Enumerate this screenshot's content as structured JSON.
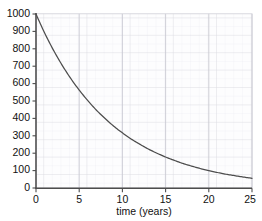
{
  "chart_data": {
    "type": "line",
    "title": "",
    "subtitle": "",
    "xlabel": "time (years)",
    "ylabel": "",
    "xlim": [
      0,
      25
    ],
    "ylim": [
      0,
      1000
    ],
    "xticks": [
      0,
      5,
      10,
      15,
      20,
      25
    ],
    "xtick_labels": [
      "0",
      "5",
      "10",
      "15",
      "20",
      "25"
    ],
    "yticks": [
      0,
      100,
      200,
      300,
      400,
      500,
      600,
      700,
      800,
      900,
      1000
    ],
    "ytick_labels": [
      "0",
      "100",
      "200",
      "300",
      "400",
      "500",
      "600",
      "700",
      "800",
      "900",
      "1000"
    ],
    "grid": "major and minor, both axes",
    "legend": "none",
    "annotations": [],
    "series": [
      {
        "name": "exponential decay",
        "color": "#4d4d4d",
        "equation": "N = 1000 * e^(-0.115 t)",
        "x": [
          0,
          1,
          2,
          3,
          4,
          5,
          6,
          7,
          8,
          9,
          10,
          11,
          12,
          13,
          14,
          15,
          16,
          17,
          18,
          19,
          20,
          21,
          22,
          23,
          24,
          25
        ],
        "values": [
          1000,
          891,
          794,
          708,
          631,
          563,
          502,
          447,
          399,
          355,
          317,
          282,
          252,
          224,
          200,
          178,
          159,
          141,
          126,
          112,
          100,
          89,
          79,
          71,
          63,
          56
        ]
      }
    ]
  },
  "axes": {
    "x_axis_name": "time-axis",
    "y_axis_name": "count-axis"
  },
  "colors": {
    "curve": "#4d4d4d",
    "axis": "#4d4d4d",
    "grid_major": "#d2d2d8",
    "grid_minor": "#eaeaef",
    "plot_background": "#fcfcfd",
    "text": "#111111"
  }
}
